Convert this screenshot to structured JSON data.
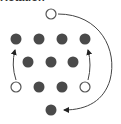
{
  "caption": "Rotation",
  "colors": {
    "filled": "#4a4a4a",
    "hollow_stroke": "#555555",
    "arrow": "#333333",
    "background": "#ffffff"
  },
  "nodes": [
    {
      "id": "top",
      "x": 51,
      "y": 14,
      "type": "hollow"
    },
    {
      "id": "r1c1",
      "x": 16,
      "y": 39,
      "type": "filled"
    },
    {
      "id": "r1c2",
      "x": 39,
      "y": 39,
      "type": "filled"
    },
    {
      "id": "r1c3",
      "x": 62,
      "y": 39,
      "type": "filled"
    },
    {
      "id": "r1c4",
      "x": 85,
      "y": 39,
      "type": "filled"
    },
    {
      "id": "r2c1",
      "x": 28,
      "y": 62,
      "type": "filled"
    },
    {
      "id": "r2c2",
      "x": 51,
      "y": 62,
      "type": "filled"
    },
    {
      "id": "r2c3",
      "x": 73,
      "y": 62,
      "type": "filled"
    },
    {
      "id": "r3c1",
      "x": 16,
      "y": 87,
      "type": "hollow"
    },
    {
      "id": "r3c2",
      "x": 39,
      "y": 87,
      "type": "filled"
    },
    {
      "id": "r3c3",
      "x": 62,
      "y": 87,
      "type": "filled"
    },
    {
      "id": "r3c4",
      "x": 85,
      "y": 87,
      "type": "hollow"
    },
    {
      "id": "bottom",
      "x": 51,
      "y": 110,
      "type": "filled"
    }
  ],
  "arrows": [
    {
      "id": "left-up",
      "from": "r3c1",
      "to": "r1c1"
    },
    {
      "id": "right-up",
      "from": "r3c4",
      "to": "r1c4"
    },
    {
      "id": "top-to-bottom-arc",
      "from": "top",
      "to": "bottom"
    }
  ]
}
